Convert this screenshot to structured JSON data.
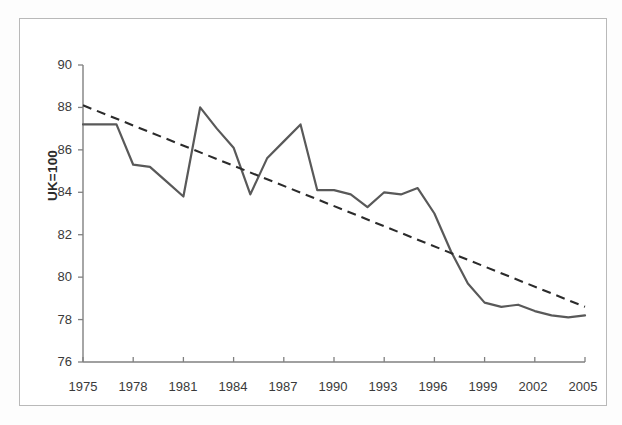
{
  "chart_data": {
    "type": "line",
    "title": "",
    "xlabel": "",
    "ylabel": "UK=100",
    "xlim": [
      1975,
      2005
    ],
    "ylim": [
      76,
      90
    ],
    "ytick_step": 2,
    "xtick_step": 3,
    "grid": false,
    "legend": "none",
    "yticks": [
      76,
      78,
      80,
      82,
      84,
      86,
      88,
      90
    ],
    "xticks": [
      1975,
      1978,
      1981,
      1984,
      1987,
      1990,
      1993,
      1996,
      1999,
      2002,
      2005
    ],
    "x": [
      1975,
      1976,
      1977,
      1978,
      1979,
      1980,
      1981,
      1982,
      1983,
      1984,
      1985,
      1986,
      1987,
      1988,
      1989,
      1990,
      1991,
      1992,
      1993,
      1994,
      1995,
      1996,
      1997,
      1998,
      1999,
      2000,
      2001,
      2002,
      2003,
      2004,
      2005
    ],
    "series": [
      {
        "name": "Index (UK=100)",
        "style": "solid",
        "color": "#595959",
        "values": [
          87.2,
          87.2,
          87.2,
          85.3,
          85.2,
          84.5,
          83.8,
          88.0,
          87.0,
          86.1,
          83.9,
          85.6,
          86.4,
          87.2,
          84.1,
          84.1,
          83.9,
          83.3,
          84.0,
          83.9,
          84.2,
          83.0,
          81.2,
          79.7,
          78.8,
          78.6,
          78.7,
          78.4,
          78.2,
          78.1,
          78.2
        ]
      },
      {
        "name": "Linear trend",
        "style": "dashed",
        "color": "#2b2b2b",
        "endpoints": [
          [
            1975,
            88.1
          ],
          [
            2005,
            78.6
          ]
        ]
      }
    ],
    "annotations": []
  },
  "axis": {
    "y_title": "UK=100",
    "y_tick_labels": [
      "90",
      "88",
      "86",
      "84",
      "82",
      "80",
      "78",
      "76"
    ],
    "x_tick_labels": [
      "1975",
      "1978",
      "1981",
      "1984",
      "1987",
      "1990",
      "1993",
      "1996",
      "1999",
      "2002",
      "2005"
    ]
  },
  "colors": {
    "series_line": "#595959",
    "trend_line": "#2b2b2b",
    "axis": "#808080",
    "border": "#b9b9b9",
    "text": "#3a3a3a"
  }
}
